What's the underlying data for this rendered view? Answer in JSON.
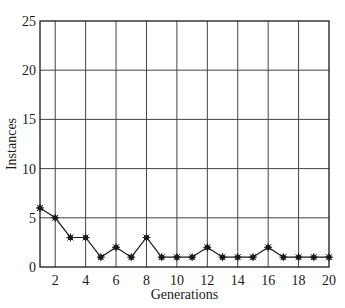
{
  "chart_data": {
    "type": "line",
    "title": "",
    "xlabel": "Generations",
    "ylabel": "Instances",
    "x": [
      1,
      2,
      3,
      4,
      5,
      6,
      7,
      8,
      9,
      10,
      11,
      12,
      13,
      14,
      15,
      16,
      17,
      18,
      19,
      20
    ],
    "series": [
      {
        "name": "Instances",
        "values": [
          6,
          5,
          3,
          3,
          1,
          2,
          1,
          3,
          1,
          1,
          1,
          2,
          1,
          1,
          1,
          2,
          1,
          1,
          1,
          1
        ],
        "marker": "star",
        "color": "#1a1a1a"
      }
    ],
    "xlim": [
      1,
      20
    ],
    "ylim": [
      0,
      25
    ],
    "xticks": [
      2,
      4,
      6,
      8,
      10,
      12,
      14,
      16,
      18,
      20
    ],
    "yticks": [
      0,
      5,
      10,
      15,
      20,
      25
    ],
    "grid": true,
    "legend": "none"
  },
  "layout": {
    "plot": {
      "left": 40,
      "top": 21,
      "right": 329,
      "bottom": 267
    },
    "colors": {
      "axis": "#1a1a1a",
      "grid": "#444444",
      "line": "#1a1a1a"
    }
  }
}
